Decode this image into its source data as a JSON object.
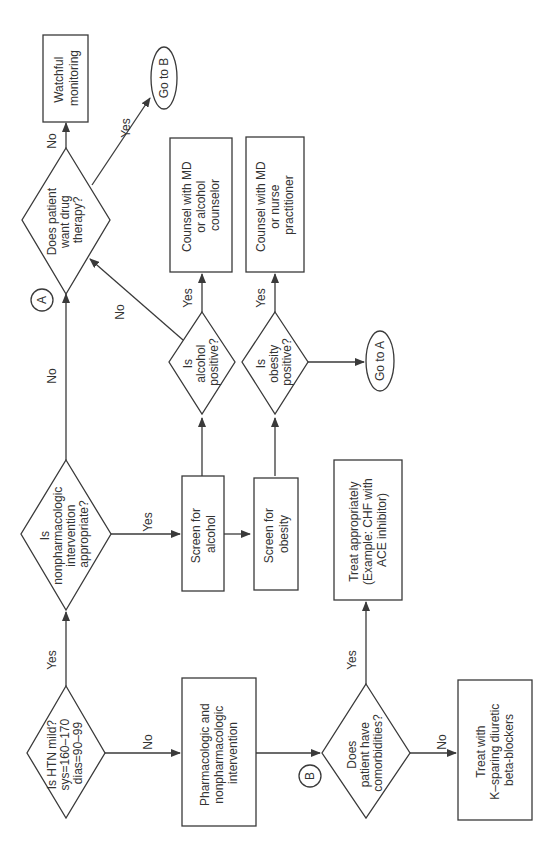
{
  "diagram": {
    "orientation": "rotated-90-ccw",
    "nodes": {
      "htn_mild": {
        "type": "decision",
        "lines": [
          "Is HTN mild?",
          "sys=160–170",
          "dias=90–99"
        ]
      },
      "pharm_nonpharm": {
        "type": "process",
        "lines": [
          "Pharmacologic and",
          "nonpharmacologic",
          "intervention"
        ]
      },
      "comorbidities": {
        "type": "decision",
        "lines": [
          "Does",
          "patient have",
          "comorbidities?"
        ]
      },
      "treat_appropriately": {
        "type": "process",
        "lines": [
          "Treat appropriately",
          "(Example: CHF with",
          "ACE inhibitor)"
        ]
      },
      "treat_k_sparing": {
        "type": "process",
        "lines": [
          "Treat with",
          "K–sparing diuretic",
          "beta-blockers"
        ]
      },
      "nonpharm_appropriate": {
        "type": "decision",
        "lines": [
          "Is",
          "nonpharmacologic",
          "intervention",
          "appropriate?"
        ]
      },
      "screen_alcohol": {
        "type": "process",
        "lines": [
          "Screen for",
          "alcohol"
        ]
      },
      "screen_obesity": {
        "type": "process",
        "lines": [
          "Screen for",
          "obesity"
        ]
      },
      "alcohol_positive": {
        "type": "decision",
        "lines": [
          "Is",
          "alcohol",
          "positive?"
        ]
      },
      "obesity_positive": {
        "type": "decision",
        "lines": [
          "Is",
          "obesity",
          "positive?"
        ]
      },
      "counsel_alcohol": {
        "type": "process",
        "lines": [
          "Counsel with MD",
          "or alcohol",
          "counselor"
        ]
      },
      "counsel_obesity": {
        "type": "process",
        "lines": [
          "Counsel with MD",
          "or nurse",
          "practitioner"
        ]
      },
      "go_to_a": {
        "type": "terminal",
        "lines": [
          "Go to A"
        ]
      },
      "drug_therapy": {
        "type": "decision",
        "lines": [
          "Does patient",
          "want drug",
          "therapy?"
        ]
      },
      "watchful": {
        "type": "process",
        "lines": [
          "Watchful",
          "monitoring"
        ]
      },
      "go_to_b": {
        "type": "terminal",
        "lines": [
          "Go to B"
        ]
      }
    },
    "connectors": {
      "a": "A",
      "b": "B"
    },
    "edges": {
      "htn_yes": "Yes",
      "htn_no": "No",
      "comorb_yes": "Yes",
      "comorb_no": "No",
      "nonpharm_yes": "Yes",
      "nonpharm_no": "No",
      "alcohol_yes": "Yes",
      "alcohol_no": "No",
      "obesity_yes": "Yes",
      "drug_no": "No",
      "drug_yes": "Yes"
    }
  }
}
